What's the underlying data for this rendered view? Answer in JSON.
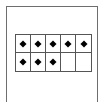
{
  "diagram": {
    "type": "ten-frame",
    "rows": 2,
    "columns": 5,
    "filled_cells": [
      true,
      true,
      true,
      true,
      true,
      true,
      true,
      true,
      false,
      false
    ],
    "dot_count": 8,
    "colors": {
      "border": "#6e6e6e",
      "grid": "#555555",
      "dot": "#000000"
    }
  }
}
